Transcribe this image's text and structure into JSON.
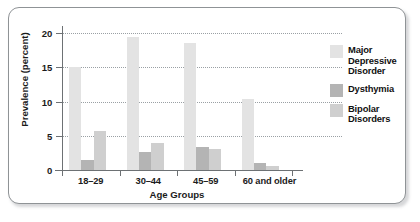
{
  "chart_data": {
    "type": "bar",
    "title": "",
    "xlabel": "Age Groups",
    "ylabel": "Prevalence (percent)",
    "categories": [
      "18–29",
      "30–44",
      "45–59",
      "60 and older"
    ],
    "series": [
      {
        "name": "Major Depressive Disorder",
        "values": [
          15.1,
          19.4,
          18.5,
          10.4
        ],
        "color": "#e3e3e3"
      },
      {
        "name": "Dysthymia",
        "values": [
          1.5,
          2.6,
          3.3,
          1.0
        ],
        "color": "#b4b4b4"
      },
      {
        "name": "Bipolar Disorders",
        "values": [
          5.7,
          4.0,
          3.1,
          0.6
        ],
        "color": "#cfcfcf"
      }
    ],
    "ylim": [
      0,
      20
    ],
    "yticks": [
      0,
      5,
      10,
      15,
      20
    ],
    "ytick_labels": [
      "0",
      "5",
      "10",
      "15",
      "20"
    ],
    "grid": "horizontal-dotted",
    "legend_position": "right"
  },
  "legend": {
    "entries": [
      {
        "label": "Major\nDepressive\nDisorder"
      },
      {
        "label": "Dysthymia"
      },
      {
        "label": "Bipolar\nDisorders"
      }
    ]
  }
}
